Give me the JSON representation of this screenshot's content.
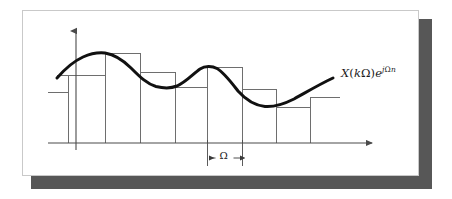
{
  "figure": {
    "background_color": "#ffffff",
    "panel": {
      "background_color": "#ffffff",
      "border_color": "#c9c9c9",
      "shadow_color": "#575757"
    }
  },
  "labels": {
    "curve_label": {
      "full_text": "X(kΩ)e^{jΩn}",
      "x_symbol": "X",
      "open_paren": "(",
      "k_symbol": "k",
      "omega_symbol": "Ω",
      "close_paren": ")",
      "e_symbol": "e",
      "exponent_j": "j",
      "exponent_omega": "Ω",
      "exponent_n": "n"
    },
    "interval_label": {
      "text": "Ω",
      "description": "sampling interval width marker"
    }
  },
  "axes": {
    "x_axis": {
      "color": "#4a4a4a",
      "y_position": 143,
      "x_start": 48,
      "x_end": 378,
      "arrow": "right-arrow-icon"
    },
    "y_axis": {
      "color": "#4a4a4a",
      "x_position": 76,
      "y_start": 143,
      "y_end": 25,
      "arrow": "up-arrow-icon"
    }
  },
  "chart_data": {
    "type": "line",
    "title": "",
    "xlabel": "",
    "ylabel": "",
    "grid": false,
    "legend": null,
    "annotations": [
      {
        "name": "curve-label",
        "text": "X(kΩ)e^{jΩn}",
        "x": 341,
        "y": 66
      },
      {
        "name": "interval-marker",
        "text": "Ω",
        "x": 215,
        "y": 150
      }
    ],
    "series": [
      {
        "name": "continuous-signal",
        "type": "line",
        "color": "#111111",
        "width": 3,
        "points": [
          [
            57,
            78
          ],
          [
            64,
            71
          ],
          [
            72,
            64
          ],
          [
            82,
            58
          ],
          [
            93,
            54
          ],
          [
            105,
            53
          ],
          [
            117,
            56
          ],
          [
            128,
            63
          ],
          [
            140,
            72
          ],
          [
            152,
            80
          ],
          [
            163,
            85
          ],
          [
            175,
            87
          ],
          [
            186,
            83
          ],
          [
            197,
            73
          ],
          [
            207,
            67
          ],
          [
            217,
            67
          ],
          [
            228,
            74
          ],
          [
            240,
            86
          ],
          [
            252,
            97
          ],
          [
            264,
            104
          ],
          [
            276,
            106
          ],
          [
            288,
            103
          ],
          [
            300,
            97
          ],
          [
            312,
            90
          ],
          [
            324,
            83
          ],
          [
            333,
            78
          ]
        ]
      },
      {
        "name": "sample-hold-rectangles",
        "type": "bar",
        "color": "#6e6e6e",
        "width": 1,
        "baseline_y": 143,
        "edges": [
          68,
          105,
          140,
          175,
          207,
          242,
          276,
          310
        ],
        "bars": [
          {
            "index": 0,
            "x_left": 68,
            "x_right": 105,
            "top_y": 75
          },
          {
            "index": 1,
            "x_left": 105,
            "x_right": 140,
            "top_y": 53
          },
          {
            "index": 2,
            "x_left": 140,
            "x_right": 175,
            "top_y": 72
          },
          {
            "index": 3,
            "x_left": 175,
            "x_right": 207,
            "top_y": 87
          },
          {
            "index": 4,
            "x_left": 207,
            "x_right": 242,
            "top_y": 67
          },
          {
            "index": 5,
            "x_left": 242,
            "x_right": 276,
            "top_y": 89
          },
          {
            "index": 6,
            "x_left": 276,
            "x_right": 310,
            "top_y": 107
          },
          {
            "index": 7,
            "x_left": 310,
            "x_right": 340,
            "top_y": 97
          }
        ]
      },
      {
        "name": "left-hold-stubs",
        "type": "segments",
        "color": "#6e6e6e",
        "segments": [
          {
            "x1": 48,
            "y1": 92,
            "x2": 68,
            "y2": 92
          },
          {
            "x1": 57,
            "y1": 75,
            "x2": 68,
            "y2": 75
          }
        ]
      },
      {
        "name": "label-leader-line",
        "type": "segments",
        "color": "#6e6e6e",
        "segments": [
          {
            "x1": 310,
            "y1": 97,
            "x2": 340,
            "y2": 97
          }
        ]
      }
    ],
    "interval_marker": {
      "name": "omega-interval",
      "x_left": 207,
      "x_right": 242,
      "y": 158,
      "tick_top_y": 140,
      "tick_bottom_y": 166,
      "color": "#4a4a4a",
      "label": "Ω"
    }
  }
}
